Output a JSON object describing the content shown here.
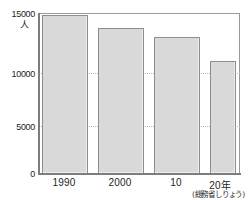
{
  "chart_data": {
    "type": "bar",
    "title": "",
    "subtitle": "",
    "xlabel": "",
    "ylabel": "人",
    "unit_label": "人",
    "categories": [
      "1990",
      "2000",
      "10",
      "20年"
    ],
    "values": [
      14800,
      13600,
      12750,
      10550
    ],
    "ylim": [
      0,
      15000
    ],
    "yticks": [
      0,
      5000,
      10000,
      15000
    ],
    "ytick_labels": [
      "0",
      "5000",
      "10000",
      "15000"
    ],
    "xtick_labels": [
      "1990",
      "2000",
      "10",
      "20年"
    ],
    "grid": true,
    "grid_style": "dotted",
    "legend": null,
    "annotations": [
      "(総務省しりょう)"
    ],
    "source_note": "(総務省しりょう)",
    "colors": {
      "bar_fill": "#d9d9d9",
      "bar_border": "#8e8e8e",
      "axis": "#7d7d7d",
      "grid": "#b4b4b4",
      "text": "#1e1e1e",
      "background": "#ffffff"
    }
  }
}
